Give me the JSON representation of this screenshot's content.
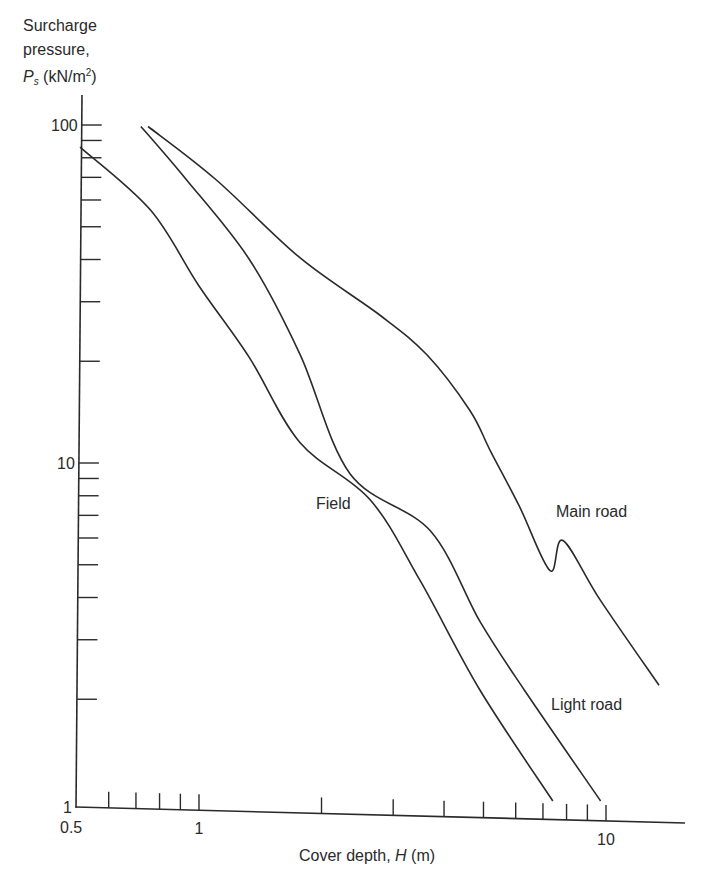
{
  "chart_data": {
    "type": "line",
    "title": "",
    "xlabel": "Cover depth, H (m)",
    "ylabel": "Surcharge pressure, Ps (kN/m²)",
    "xscale": "log",
    "yscale": "log",
    "xlim": [
      0.5,
      15
    ],
    "ylim": [
      1,
      100
    ],
    "grid": false,
    "legend": "inline labels",
    "x_tick_labels": [
      {
        "value": 0.5,
        "label": "0.5"
      },
      {
        "value": 1,
        "label": "1"
      },
      {
        "value": 10,
        "label": "10"
      }
    ],
    "x_minor_ticks": [
      0.6,
      0.7,
      0.8,
      0.9,
      1,
      2,
      3,
      4,
      5,
      6,
      7,
      8,
      9,
      10
    ],
    "y_tick_labels": [
      {
        "value": 1,
        "label": "1"
      },
      {
        "value": 10,
        "label": "10"
      },
      {
        "value": 100,
        "label": "100"
      }
    ],
    "y_minor_ticks": [
      2,
      3,
      4,
      5,
      6,
      7,
      8,
      9,
      10,
      20,
      30,
      40,
      50,
      60,
      70,
      80,
      90,
      100
    ],
    "series": [
      {
        "name": "Field",
        "label_pos": {
          "x": 316,
          "y": 509
        },
        "x": [
          0.51,
          0.76,
          1.0,
          1.33,
          1.77,
          2.63,
          3.49,
          4.9,
          7.4
        ],
        "y": [
          86,
          56,
          33.4,
          20.5,
          11.5,
          7.8,
          4.5,
          2.13,
          1.0
        ]
      },
      {
        "name": "Light road",
        "label_pos": {
          "x": 551,
          "y": 710
        },
        "x": [
          0.72,
          0.93,
          1.33,
          1.77,
          2.35,
          3.7,
          4.9,
          6.3,
          9.7
        ],
        "y": [
          99,
          69,
          40,
          21,
          9.3,
          6.3,
          3.4,
          2.13,
          1.0
        ]
      },
      {
        "name": "Main road",
        "label_pos": {
          "x": 556,
          "y": 517
        },
        "x": [
          0.75,
          1.1,
          1.77,
          2.78,
          3.63,
          4.63,
          5.19,
          6.14,
          7.29,
          7.84,
          9.68,
          13.5
        ],
        "y": [
          99,
          69,
          40.5,
          27.4,
          20.9,
          14.3,
          10.9,
          7.4,
          4.8,
          5.9,
          3.93,
          2.2
        ]
      }
    ]
  },
  "axes": {
    "ylabel_lines": [
      "Surcharge",
      "pressure,"
    ],
    "ylabel_symbol": "P",
    "ylabel_subscript": "s",
    "ylabel_unit_pre": " (kN/m",
    "ylabel_unit_sup": "2",
    "ylabel_unit_post": ")",
    "xlabel_text": "Cover depth, ",
    "xlabel_symbol": "H",
    "xlabel_unit": " (m)"
  }
}
